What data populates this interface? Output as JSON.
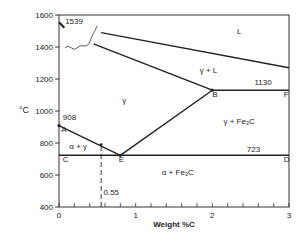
{
  "chart_data": {
    "type": "line",
    "title": "",
    "xlabel": "Weight %C",
    "ylabel": "°C",
    "xlim": [
      0,
      3
    ],
    "ylim": [
      400,
      1600
    ],
    "x_ticks": [
      {
        "value": 0,
        "label": "0"
      },
      {
        "value": 1,
        "label": "1"
      },
      {
        "value": 2,
        "label": "2"
      },
      {
        "value": 3,
        "label": "3"
      }
    ],
    "x_minor_step": 0.2,
    "y_ticks": [
      {
        "value": 400,
        "label": "400"
      },
      {
        "value": 600,
        "label": "600"
      },
      {
        "value": 800,
        "label": "800"
      },
      {
        "value": 1000,
        "label": "1000"
      },
      {
        "value": 1200,
        "label": "1200"
      },
      {
        "value": 1400,
        "label": "1400"
      },
      {
        "value": 1600,
        "label": "1600"
      }
    ],
    "points": {
      "A": {
        "x": 0,
        "y": 908
      },
      "E": {
        "x": 0.8,
        "y": 723
      },
      "B": {
        "x": 2.0,
        "y": 1130
      },
      "C": {
        "x": 0,
        "y": 723
      },
      "D": {
        "x": 3,
        "y": 723
      },
      "F": {
        "x": 3,
        "y": 1130
      },
      "ref": {
        "x": 0.55,
        "y": 790
      }
    },
    "series": [
      {
        "name": "A-E (gamma/alpha+gamma boundary)",
        "x": [
          0,
          0.8
        ],
        "y": [
          908,
          723
        ]
      },
      {
        "name": "E-B (Acm line)",
        "x": [
          0.8,
          2.0
        ],
        "y": [
          723,
          1130
        ]
      },
      {
        "name": "eutectoid line C-D",
        "x": [
          0,
          3
        ],
        "y": [
          723,
          723
        ]
      },
      {
        "name": "eutectic line B-F",
        "x": [
          2.0,
          3
        ],
        "y": [
          1130,
          1130
        ]
      },
      {
        "name": "solidus",
        "x": [
          0.45,
          2.0
        ],
        "y": [
          1420,
          1130
        ]
      },
      {
        "name": "liquidus",
        "x": [
          0.55,
          3
        ],
        "y": [
          1490,
          1270
        ]
      },
      {
        "name": "0.55 reference",
        "x": [
          0.55,
          0.55
        ],
        "y": [
          400,
          790
        ],
        "style": "dashed"
      }
    ],
    "annotations": [
      {
        "text": "1539",
        "x": 0.08,
        "y": 1545
      },
      {
        "text": "908",
        "x": 0.05,
        "y": 945
      },
      {
        "text": "1130",
        "x": 2.55,
        "y": 1160
      },
      {
        "text": "723",
        "x": 2.45,
        "y": 745
      },
      {
        "text": "0.55",
        "x": 0.58,
        "y": 475
      },
      {
        "text": "A",
        "x": 0.03,
        "y": 870
      },
      {
        "text": "B",
        "x": 2.0,
        "y": 1090
      },
      {
        "text": "C",
        "x": 0.05,
        "y": 680
      },
      {
        "text": "D",
        "x": 2.93,
        "y": 680
      },
      {
        "text": "E",
        "x": 0.78,
        "y": 680
      },
      {
        "text": "F",
        "x": 2.93,
        "y": 1090
      }
    ],
    "regions": [
      {
        "label": "L",
        "x": 2.35,
        "y": 1480
      },
      {
        "label": "γ + L",
        "x": 1.95,
        "y": 1240
      },
      {
        "label": "γ",
        "x": 0.85,
        "y": 1050
      },
      {
        "label": "γ + Fe₃C",
        "x": 2.35,
        "y": 920
      },
      {
        "label": "α + γ",
        "x": 0.25,
        "y": 765
      },
      {
        "label": "α + Fe₃C",
        "x": 1.55,
        "y": 600
      }
    ],
    "grid": false,
    "legend": "none"
  }
}
